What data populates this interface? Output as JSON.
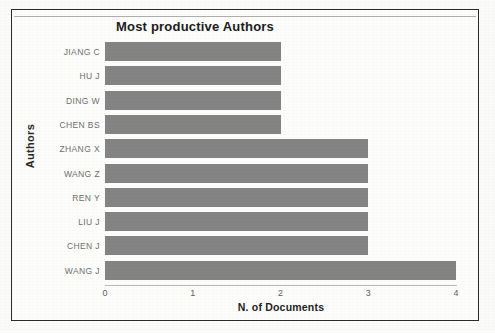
{
  "figure": {
    "title": "Most productive Authors",
    "bar_color": "#848484",
    "frame_color": "#2b2b2b",
    "background_color": "#fdfdfc"
  },
  "chart_data": {
    "type": "bar",
    "orientation": "horizontal",
    "title": "Most productive Authors",
    "xlabel": "N. of Documents",
    "ylabel": "Authors",
    "categories": [
      "JIANG C",
      "HU J",
      "DING W",
      "CHEN BS",
      "ZHANG X",
      "WANG Z",
      "REN Y",
      "LIU J",
      "CHEN J",
      "WANG J"
    ],
    "values": [
      2,
      2,
      2,
      2,
      3,
      3,
      3,
      3,
      3,
      4
    ],
    "xlim": [
      0,
      4
    ],
    "xticks": [
      0,
      1,
      2,
      3,
      4
    ],
    "xtick_labels": [
      "0",
      "1",
      "2",
      "3",
      "4"
    ],
    "grid": false,
    "legend": false
  }
}
